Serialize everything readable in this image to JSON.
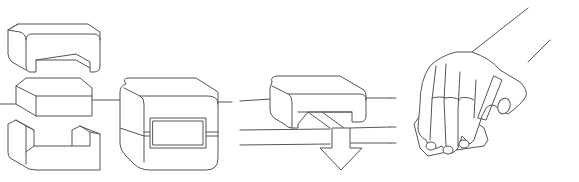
{
  "diagram": {
    "type": "instructional-illustration",
    "steps": [
      {
        "id": 1,
        "label": "",
        "description": "exploded-view-clip-core-halves-around-cable"
      },
      {
        "id": 2,
        "label": "",
        "description": "assembled-ferrite-core-on-cable"
      },
      {
        "id": 3,
        "label": "",
        "description": "press-core-half-down-onto-cable-arrow"
      },
      {
        "id": 4,
        "label": "",
        "description": "hand-squeezing-core-closed"
      }
    ],
    "colors": {
      "line": "#555555",
      "background": "#ffffff"
    }
  }
}
